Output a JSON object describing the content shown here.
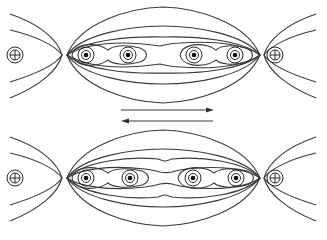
{
  "diagram": {
    "title": "",
    "colors": {
      "line": "#3a3a3a",
      "background": "#ffffff",
      "dot": "#111111"
    },
    "panels": [
      {
        "id": "top",
        "center_y": 55,
        "conductors": [
          {
            "type": "into-page",
            "symbol": "⊕",
            "x": 15
          },
          {
            "type": "out-of-page",
            "symbol": "⊙",
            "x": 86
          },
          {
            "type": "out-of-page",
            "symbol": "⊙",
            "x": 128
          },
          {
            "type": "out-of-page",
            "symbol": "⊙",
            "x": 194
          },
          {
            "type": "out-of-page",
            "symbol": "⊙",
            "x": 235
          },
          {
            "type": "into-page",
            "symbol": "⊕",
            "x": 275
          }
        ]
      },
      {
        "id": "bottom",
        "center_y": 178,
        "conductors": [
          {
            "type": "into-page",
            "symbol": "⊕",
            "x": 15
          },
          {
            "type": "out-of-page",
            "symbol": "⊙",
            "x": 86
          },
          {
            "type": "out-of-page",
            "symbol": "⊙",
            "x": 130
          },
          {
            "type": "out-of-page",
            "symbol": "⊙",
            "x": 193
          },
          {
            "type": "out-of-page",
            "symbol": "⊙",
            "x": 236
          },
          {
            "type": "into-page",
            "symbol": "⊕",
            "x": 275
          }
        ]
      }
    ],
    "arrows": [
      {
        "direction": "right",
        "y": 110,
        "x1": 121,
        "x2": 214
      },
      {
        "direction": "left",
        "y": 121,
        "x1": 121,
        "x2": 213
      }
    ]
  }
}
